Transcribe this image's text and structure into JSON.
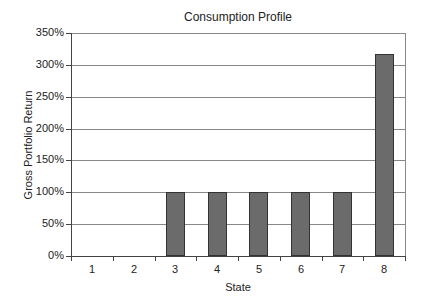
{
  "chart_data": {
    "type": "bar",
    "title": "Consumption Profile",
    "xlabel": "State",
    "ylabel": "Gross Portfolio Return",
    "categories": [
      "1",
      "2",
      "3",
      "4",
      "5",
      "6",
      "7",
      "8"
    ],
    "values": [
      0,
      0,
      100,
      100,
      100,
      100,
      100,
      317
    ],
    "value_unit": "%",
    "ylim": [
      0,
      350
    ],
    "yticks": [
      "0%",
      "50%",
      "100%",
      "150%",
      "200%",
      "250%",
      "300%",
      "350%"
    ],
    "grid": true,
    "legend": "none",
    "bar_color": "#6b6b6b"
  }
}
